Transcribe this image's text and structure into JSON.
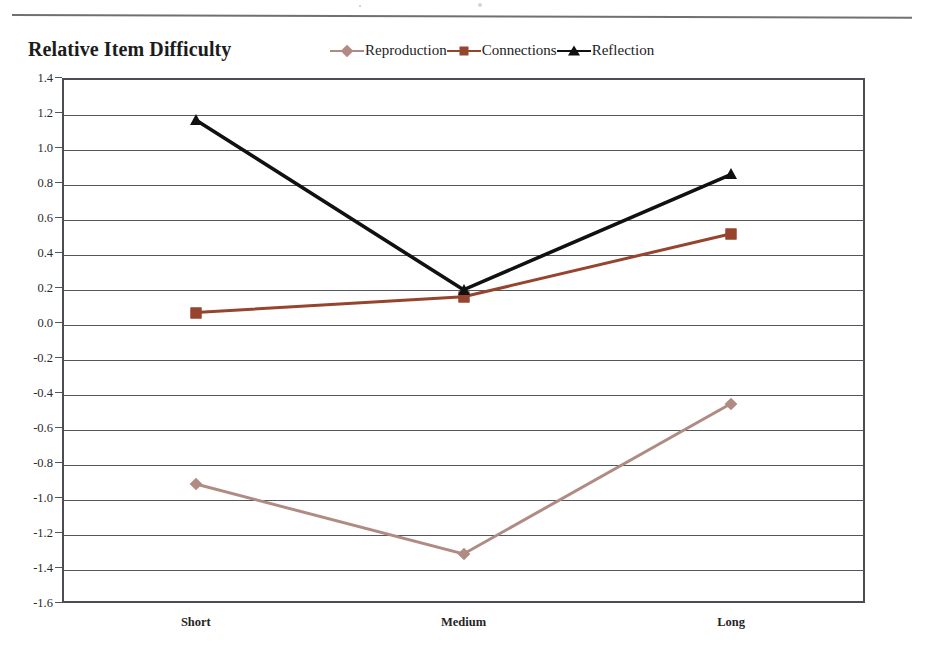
{
  "page": {
    "rule_name": "horizontal-rule"
  },
  "chart_data": {
    "type": "line",
    "title": "Relative Item Difficulty",
    "xlabel": "",
    "ylabel": "",
    "categories": [
      "Short",
      "Medium",
      "Long"
    ],
    "ylim": [
      -1.6,
      1.4
    ],
    "ytick_step": 0.2,
    "ytick_labels": [
      "1.4",
      "1.2",
      "1.0",
      "0.8",
      "0.6",
      "0.4",
      "0.2",
      "0.0",
      "-0.2",
      "-0.4",
      "-0.6",
      "-0.8",
      "-1.0",
      "-1.2",
      "-1.4",
      "-1.6"
    ],
    "ytick_values": [
      1.4,
      1.2,
      1.0,
      0.8,
      0.6,
      0.4,
      0.2,
      0.0,
      -0.2,
      -0.4,
      -0.6,
      -0.8,
      -1.0,
      -1.2,
      -1.4,
      -1.6
    ],
    "grid": true,
    "grid_axis": "y",
    "legend_position": "top-center",
    "series": [
      {
        "name": "Reproduction",
        "marker": "diamond",
        "color": "#b08b84",
        "values": [
          -0.92,
          -1.32,
          -0.46
        ]
      },
      {
        "name": "Connections",
        "marker": "square",
        "color": "#96442e",
        "values": [
          0.06,
          0.15,
          0.51
        ]
      },
      {
        "name": "Reflection",
        "marker": "triangle",
        "color": "#111111",
        "values": [
          1.16,
          0.19,
          0.85
        ]
      }
    ]
  }
}
